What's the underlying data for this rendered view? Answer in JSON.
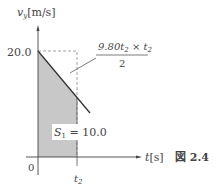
{
  "figure": {
    "caption": "図 2.4",
    "y_axis_label": "v",
    "y_axis_sub": "y",
    "y_axis_unit": "[m/s]",
    "x_axis_label": "t",
    "x_axis_unit": "[s]",
    "origin_label": "0",
    "y_tick_label": "20.0",
    "x_tick_label": "t",
    "x_tick_sub": "2",
    "area_label": "S",
    "area_sub": "1",
    "area_value": " = 10.0",
    "annotation_numerator": "9.80t",
    "annotation_num_sub": "2",
    "annotation_times": " × t",
    "annotation_times_sub": "2",
    "annotation_denominator": "2"
  },
  "colors": {
    "shade": "#c8c8c8",
    "line": "#333333",
    "dash": "#888888"
  }
}
